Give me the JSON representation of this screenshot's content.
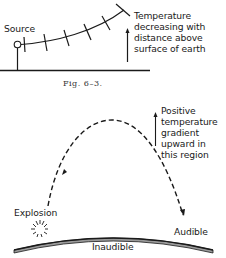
{
  "figure_top": {
    "source_label": "Source",
    "annotation_lines": [
      "Temperature",
      "decreasing with",
      "distance above",
      "surface of earth"
    ],
    "caption": "Fig. 6–3."
  },
  "figure_bottom": {
    "annotation_lines": [
      "Positive",
      "temperature",
      "gradient",
      "upward in",
      "this region"
    ],
    "explosion_label": "Explosion",
    "audible_label": "Audible",
    "inaudible_label": "Inaudible"
  },
  "colors": {
    "ink": "#1a1a1a",
    "background": "#ffffff",
    "earth_fill": "#9a9a9a"
  }
}
